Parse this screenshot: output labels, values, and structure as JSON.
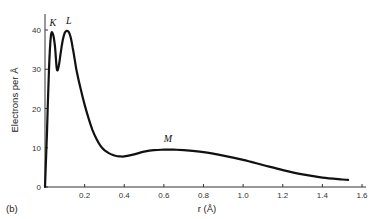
{
  "panel_label": "(b)",
  "chart_data": {
    "type": "line",
    "title": "",
    "xlabel": "r (Å)",
    "ylabel": "Electrons per Å",
    "xlim": [
      0,
      1.6
    ],
    "ylim": [
      0,
      43
    ],
    "x_ticks": [
      0.2,
      0.4,
      0.6,
      0.8,
      1.0,
      1.2,
      1.4,
      1.6
    ],
    "x_tick_labels": [
      "0.2",
      "0.4",
      "0.6",
      "0.8",
      "1.0",
      "1.2",
      "1.4",
      "1.6"
    ],
    "y_ticks": [
      0,
      10,
      20,
      30,
      40
    ],
    "y_tick_labels": [
      "0",
      "10",
      "20",
      "30",
      "40"
    ],
    "grid": false,
    "legend": null,
    "series": [
      {
        "name": "Radial electron distribution",
        "x": [
          0.0,
          0.01,
          0.02,
          0.03,
          0.04,
          0.05,
          0.06,
          0.07,
          0.08,
          0.09,
          0.1,
          0.11,
          0.12,
          0.13,
          0.14,
          0.15,
          0.16,
          0.18,
          0.2,
          0.22,
          0.24,
          0.26,
          0.28,
          0.3,
          0.32,
          0.34,
          0.36,
          0.38,
          0.4,
          0.45,
          0.5,
          0.55,
          0.6,
          0.65,
          0.7,
          0.8,
          0.9,
          1.0,
          1.1,
          1.2,
          1.3,
          1.4,
          1.5,
          1.53
        ],
        "values": [
          0,
          14,
          30,
          38.5,
          39,
          36,
          30,
          31,
          34.5,
          37.5,
          39.3,
          39.8,
          39.5,
          38,
          35.5,
          32.5,
          29.5,
          25,
          21,
          17.5,
          14.5,
          12.2,
          10.5,
          9.4,
          8.7,
          8.2,
          7.9,
          7.8,
          7.8,
          8.3,
          9.0,
          9.4,
          9.5,
          9.5,
          9.4,
          8.9,
          8.0,
          6.9,
          5.6,
          4.3,
          3.2,
          2.4,
          1.9,
          1.8
        ]
      }
    ],
    "annotations": [
      {
        "text": "K",
        "x": 0.04,
        "y": 41
      },
      {
        "text": "L",
        "x": 0.12,
        "y": 41.5
      },
      {
        "text": "M",
        "x": 0.62,
        "y": 11.5
      }
    ]
  }
}
